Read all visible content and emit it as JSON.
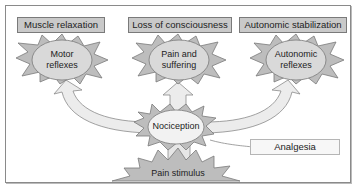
{
  "diagram": {
    "outcomes": [
      {
        "label": "Muscle relaxation"
      },
      {
        "label": "Loss of consciousness"
      },
      {
        "label": "Autonomic stabilization"
      }
    ],
    "responses": [
      {
        "line1": "Motor",
        "line2": "reflexes"
      },
      {
        "line1": "Pain and",
        "line2": "suffering"
      },
      {
        "line1": "Autonomic",
        "line2": "reflexes"
      }
    ],
    "center": {
      "label": "Nociception"
    },
    "stimulus": {
      "label": "Pain stimulus"
    },
    "modulator": {
      "label": "Analgesia"
    },
    "colors": {
      "label_fill": "#c9c9c9",
      "burst_fill": "#bdbdbd",
      "oval_fill": "#d9d9d9",
      "center_oval_fill": "#f2f2f2",
      "arrow_fill": "#ececec",
      "stroke": "#7a7a7a"
    }
  }
}
